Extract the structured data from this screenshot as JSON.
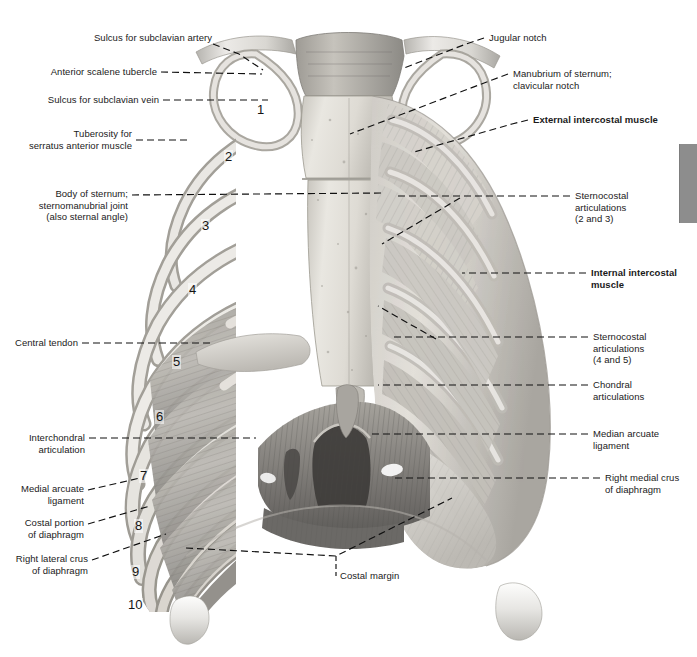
{
  "plate": {
    "title": "Thoracic cage, sternum and diaphragm — anterior view",
    "background_color": "#ffffff",
    "rule_color": "#9a9a9a",
    "tab_color": "#8d8d8d",
    "leader_color": "#101010"
  },
  "thumb_tab": {
    "name": "chapter-thumb-tab",
    "label": ""
  },
  "labels_left": [
    {
      "id": "sulcus-subclavian-artery",
      "text": "Sulcus for subclavian artery",
      "bold": false
    },
    {
      "id": "anterior-scalene-tubercle",
      "text": "Anterior scalene tubercle",
      "bold": false
    },
    {
      "id": "sulcus-subclavian-vein",
      "text": "Sulcus for subclavian vein",
      "bold": false
    },
    {
      "id": "tuberosity-serratus-anterior",
      "text": "Tuberosity for\nserratus anterior muscle",
      "bold": false
    },
    {
      "id": "body-of-sternum",
      "text": "Body of sternum;\nsternomanubrial joint\n(also sternal angle)",
      "bold": false
    },
    {
      "id": "central-tendon",
      "text": "Central tendon",
      "bold": false
    },
    {
      "id": "interchondral-articulation",
      "text": "Interchondral\narticulation",
      "bold": false
    },
    {
      "id": "medial-arcuate-ligament",
      "text": "Medial arcuate\nligament",
      "bold": false
    },
    {
      "id": "costal-portion-diaphragm",
      "text": "Costal portion\nof diaphragm",
      "bold": false
    },
    {
      "id": "right-lateral-crus-diaphragm",
      "text": "Right lateral crus\nof diaphragm",
      "bold": false
    }
  ],
  "labels_right": [
    {
      "id": "jugular-notch",
      "text": "Jugular notch",
      "bold": false
    },
    {
      "id": "manubrium-of-sternum",
      "text": "Manubrium of sternum;\nclavicular notch",
      "bold": false
    },
    {
      "id": "external-intercostal-muscle",
      "text": "External intercostal muscle",
      "bold": true
    },
    {
      "id": "sternocostal-articulations-2-3",
      "text": "Sternocostal\narticulations\n(2 and 3)",
      "bold": false
    },
    {
      "id": "internal-intercostal-muscle",
      "text": "Internal intercostal\nmuscle",
      "bold": true
    },
    {
      "id": "sternocostal-articulations-4-5",
      "text": "Sternocostal\narticulations\n(4 and 5)",
      "bold": false
    },
    {
      "id": "chondral-articulations",
      "text": "Chondral\narticulations",
      "bold": false
    },
    {
      "id": "median-arcuate-ligament",
      "text": "Median arcuate\nligament",
      "bold": false
    },
    {
      "id": "right-medial-crus-diaphragm",
      "text": "Right medial crus\nof diaphragm",
      "bold": false
    }
  ],
  "labels_bottom": [
    {
      "id": "costal-margin",
      "text": "Costal margin",
      "bold": false
    }
  ],
  "rib_numbers": [
    "1",
    "2",
    "3",
    "4",
    "5",
    "6",
    "7",
    "8",
    "9",
    "10"
  ]
}
